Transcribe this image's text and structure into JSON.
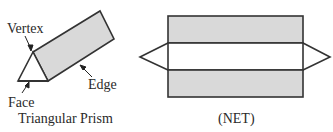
{
  "prism": {
    "title": "Triangular Prism",
    "labels": {
      "vertex": "Vertex",
      "edge": "Edge",
      "face": "Face"
    }
  },
  "net": {
    "caption": "(NET)"
  },
  "colors": {
    "face_fill": "#d9d9d9",
    "stroke": "#333333",
    "background": "#ffffff"
  }
}
